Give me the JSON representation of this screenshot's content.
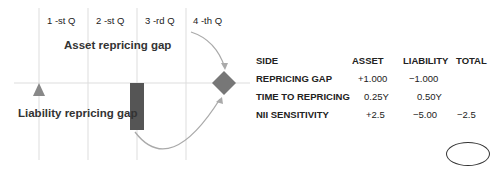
{
  "quarters": [
    "1 -st Q",
    "2 -st Q",
    "3 -rd Q",
    "4 -th Q"
  ],
  "labels": {
    "asset": "Asset repricing gap",
    "liability": "Liability repricing gap"
  },
  "table": {
    "headers": [
      "SIDE",
      "ASSET",
      "LIABILITY",
      "TOTAL"
    ],
    "rows": [
      {
        "side": "REPRICING GAP",
        "asset": "+1.000",
        "liability": "−1.000",
        "total": ""
      },
      {
        "side": "TIME TO REPRICING",
        "asset": "0.25Y",
        "liability": "0.50Y",
        "total": ""
      },
      {
        "side": "NII SENSITIVITY",
        "asset": "+2.5",
        "liability": "−5.00",
        "total": "−2.5"
      }
    ]
  },
  "colors": {
    "marker": "#777777",
    "bar": "#555555",
    "arrow": "#aaaaaa",
    "grid": "#dddddd"
  }
}
